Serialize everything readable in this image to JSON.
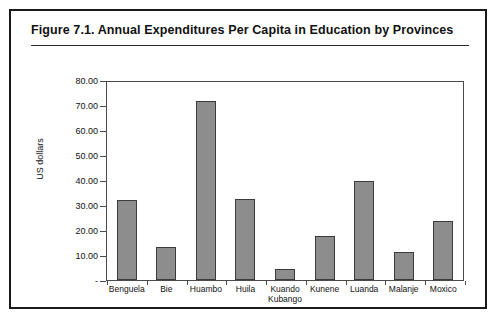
{
  "figure": {
    "title": "Figure 7.1.  Annual Expenditures Per Capita in Education by Provinces"
  },
  "chart_data": {
    "type": "bar",
    "title": "Annual Expenditures Per Capita in Education by Provinces",
    "xlabel": "",
    "ylabel": "US dollars",
    "ylim": [
      0,
      80
    ],
    "grid": false,
    "legend": null,
    "ytick_labels": [
      "80.00",
      "70.00",
      "60.00",
      "50.00",
      "40.00",
      "30.00",
      "20.00",
      "10.00",
      "-"
    ],
    "ytick_values": [
      80,
      70,
      60,
      50,
      40,
      30,
      20,
      10,
      0
    ],
    "categories": [
      "Benguela",
      "Bie",
      "Huambo",
      "Huila",
      "Kuando Kubango",
      "Kunene",
      "Luanda",
      "Malanje",
      "Moxico"
    ],
    "category_lines": [
      [
        "Benguela"
      ],
      [
        "Bie"
      ],
      [
        "Huambo"
      ],
      [
        "Huila"
      ],
      [
        "Kuando",
        "Kubango"
      ],
      [
        "Kunene"
      ],
      [
        "Luanda"
      ],
      [
        "Malanje"
      ],
      [
        "Moxico"
      ]
    ],
    "values": [
      32.2,
      13.2,
      71.8,
      32.6,
      4.6,
      17.6,
      39.7,
      11.3,
      23.6
    ],
    "bar_color": "#8d8d8d",
    "bar_border_color": "#3b3b3b",
    "axis_color": "#4a4a4a",
    "frame_color": "#1a1a1a",
    "background": "#ffffff"
  }
}
